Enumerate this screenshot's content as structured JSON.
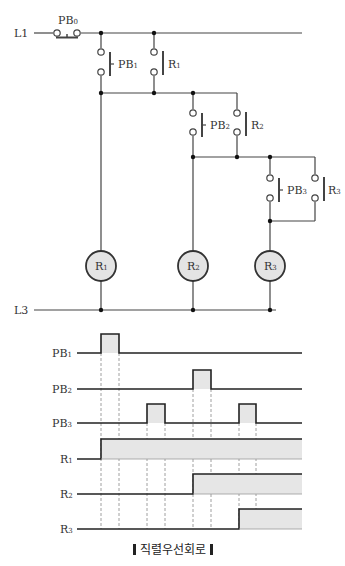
{
  "title": "직렬우선회로",
  "ladder": {
    "rails": {
      "top": "L1",
      "bottom": "L3"
    },
    "master_switch": {
      "name": "PB",
      "sub": "0",
      "type": "normally-closed push button"
    },
    "rungs": [
      {
        "contacts": [
          {
            "name": "PB",
            "sub": "1",
            "type": "NO push button"
          },
          {
            "name": "R",
            "sub": "1",
            "type": "NO relay contact (self-hold)"
          }
        ],
        "coil": {
          "name": "R",
          "sub": "1"
        }
      },
      {
        "contacts": [
          {
            "name": "PB",
            "sub": "2",
            "type": "NO push button"
          },
          {
            "name": "R",
            "sub": "2",
            "type": "NO relay contact (self-hold)"
          }
        ],
        "coil": {
          "name": "R",
          "sub": "2"
        }
      },
      {
        "contacts": [
          {
            "name": "PB",
            "sub": "3",
            "type": "NO push button"
          },
          {
            "name": "R",
            "sub": "3",
            "type": "NO relay contact (self-hold)"
          }
        ],
        "coil": {
          "name": "R",
          "sub": "3"
        }
      }
    ]
  },
  "timing": {
    "signals": [
      {
        "name": "PB",
        "sub": "1",
        "pulses": [
          [
            1,
            2
          ]
        ]
      },
      {
        "name": "PB",
        "sub": "2",
        "pulses": [
          [
            5,
            6
          ]
        ]
      },
      {
        "name": "PB",
        "sub": "3",
        "pulses": [
          [
            3,
            4
          ],
          [
            7,
            8
          ]
        ]
      },
      {
        "name": "R",
        "sub": "1",
        "on_from": 1
      },
      {
        "name": "R",
        "sub": "2",
        "on_from": 5
      },
      {
        "name": "R",
        "sub": "3",
        "on_from": 7
      }
    ]
  },
  "colors": {
    "line": "#333333",
    "fill": "#e6e6e6",
    "coil_fill": "#e4e4e4"
  }
}
